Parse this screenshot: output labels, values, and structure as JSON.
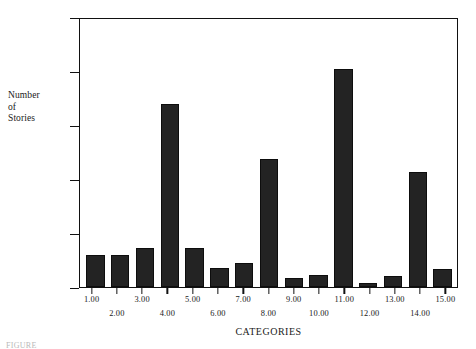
{
  "chart_data": {
    "type": "bar",
    "title": "",
    "xlabel": "CATEGORIES",
    "ylabel": "Number of Stories",
    "ylabel_lines": [
      "Number",
      "of",
      "Stories"
    ],
    "categories": [
      "1.00",
      "2.00",
      "3.00",
      "4.00",
      "5.00",
      "6.00",
      "7.00",
      "8.00",
      "9.00",
      "10.00",
      "11.00",
      "12.00",
      "13.00",
      "14.00",
      "15.00"
    ],
    "values": [
      600,
      600,
      720,
      3420,
      720,
      350,
      450,
      2380,
      170,
      230,
      4070,
      80,
      210,
      2150,
      330
    ],
    "ylim": [
      0,
      5000
    ],
    "yticks": [
      0,
      1000,
      2000,
      3000,
      4000,
      5000
    ],
    "ytick_labels": [
      "0",
      "1000",
      "2000",
      "3000",
      "4000",
      "5000"
    ],
    "grid": false,
    "legend": null,
    "bar_color": "#232323",
    "axis_color": "#111111",
    "background": "#ffffff",
    "xlabel_stagger": true
  },
  "caption": {
    "text": "FIGURE"
  }
}
